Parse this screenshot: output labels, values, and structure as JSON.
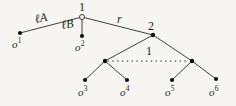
{
  "figure": {
    "kind": "tree-diagram",
    "background_color": "#f7f5f1",
    "line_color": "#2b2b2b",
    "node_fill_color": "#111111",
    "root_fill_color": "#f7f5f1"
  },
  "nodes": {
    "root": {
      "label": "1",
      "x": 82,
      "y": 17,
      "style": "hollow-circle"
    },
    "node2": {
      "label": "2",
      "x": 153,
      "y": 35,
      "style": "filled-dot"
    },
    "internal_left": {
      "label": "",
      "x": 105,
      "y": 61,
      "style": "filled-dot"
    },
    "internal_right": {
      "label": "",
      "x": 192,
      "y": 61,
      "style": "filled-dot"
    },
    "dotted_link_label": "1"
  },
  "edges": {
    "left_label_ell": "ℓ",
    "left_label_letter": "A",
    "mid_label_ell": "ℓ",
    "mid_label_letter": "B",
    "right_label": "r"
  },
  "leaves": [
    {
      "name": "o1",
      "base": "o",
      "sup": "1",
      "x": 20,
      "y": 33
    },
    {
      "name": "o2",
      "base": "o",
      "sup": "2",
      "x": 82,
      "y": 36
    },
    {
      "name": "o3",
      "base": "o",
      "sup": "3",
      "x": 85,
      "y": 80
    },
    {
      "name": "o4",
      "base": "o",
      "sup": "4",
      "x": 127,
      "y": 80
    },
    {
      "name": "o5",
      "base": "o",
      "sup": "5",
      "x": 172,
      "y": 80
    },
    {
      "name": "o6",
      "base": "o",
      "sup": "6",
      "x": 216,
      "y": 79
    }
  ]
}
